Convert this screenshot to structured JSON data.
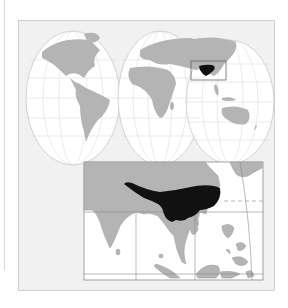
{
  "map": {
    "type": "locator-map",
    "projection": "interrupted-pseudo-conic (world)",
    "highlight_region": "southern China / Himalaya region",
    "inset_region": "South & Southeast Asia",
    "colors": {
      "background": "#f1f1f1",
      "ocean": "#ffffff",
      "land": "#b4b4b4",
      "highlight": "#111111",
      "graticule": "#c8c8c8",
      "frame": "#8a8a8a"
    }
  }
}
